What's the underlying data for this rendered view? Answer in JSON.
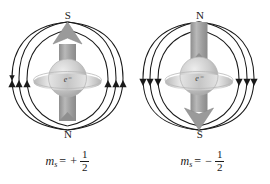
{
  "figure": {
    "background_color": "#ffffff",
    "field_line_color": "#1a1a1a",
    "axis_arrow_color": "#9a9a9a",
    "sphere_color": "#cfcfcf",
    "text_color": "#1a1a1a"
  },
  "panels": [
    {
      "id": "spin-up",
      "pole_top": "S",
      "pole_bottom": "N",
      "electron_label": "e⁻",
      "spin_symbol": "m",
      "spin_subscript": "s",
      "equals": "=",
      "sign": "+",
      "numerator": "1",
      "denominator": "2",
      "field_direction": "upward",
      "axis_arrow_direction": "up"
    },
    {
      "id": "spin-down",
      "pole_top": "N",
      "pole_bottom": "S",
      "electron_label": "e⁻",
      "spin_symbol": "m",
      "spin_subscript": "s",
      "equals": "=",
      "sign": "−",
      "numerator": "1",
      "denominator": "2",
      "field_direction": "downward",
      "axis_arrow_direction": "down"
    }
  ]
}
